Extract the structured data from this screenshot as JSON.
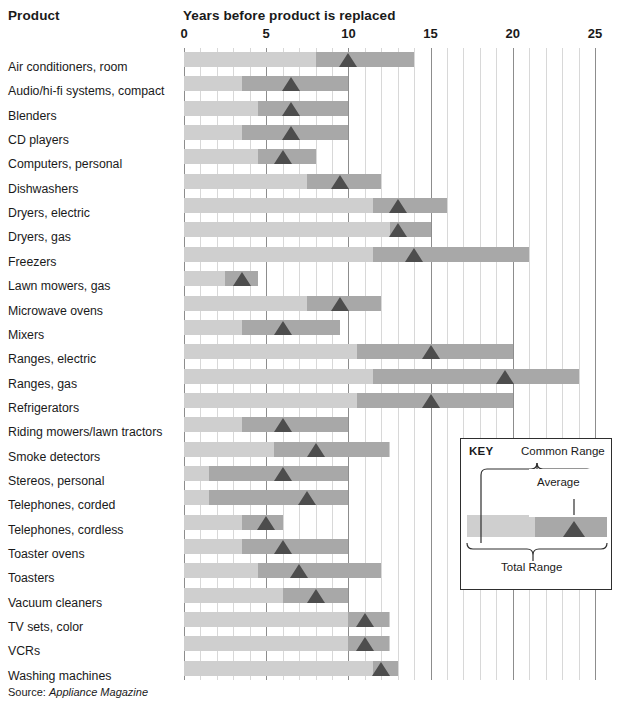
{
  "headers": {
    "product": "Product",
    "axis_title": "Years before product is replaced"
  },
  "source": {
    "prefix": "Source:",
    "name": "Appliance Magazine"
  },
  "key": {
    "title": "KEY",
    "common_range": "Common Range",
    "average": "Average",
    "total_range": "Total Range"
  },
  "colors": {
    "total_range": "#cfcfcf",
    "common_range": "#a8a8a8",
    "average_marker": "#4d4d4d",
    "grid_minor": "#d8d8d8",
    "grid_major": "#8d8d8d",
    "text": "#1a1a1a"
  },
  "chart_data": {
    "type": "bar",
    "title": "Years before product is replaced",
    "xlabel": "Years before product is replaced",
    "ylabel": "Product",
    "xlim": [
      0,
      25
    ],
    "xticks": [
      0,
      5,
      10,
      15,
      20,
      25
    ],
    "xtick_labels": [
      "0",
      "5",
      "10",
      "15",
      "20",
      "25"
    ],
    "grid": true,
    "grid_minor_step": 1,
    "grid_major_step": 5,
    "legend": "KEY box, bottom right",
    "series": [
      {
        "name": "Total Range",
        "kind": "range"
      },
      {
        "name": "Common Range",
        "kind": "range"
      },
      {
        "name": "Average",
        "kind": "marker"
      }
    ],
    "categories": [
      "Air conditioners, room",
      "Audio/hi-fi systems, compact",
      "Blenders",
      "CD players",
      "Computers, personal",
      "Dishwashers",
      "Dryers, electric",
      "Dryers, gas",
      "Freezers",
      "Lawn mowers, gas",
      "Microwave ovens",
      "Mixers",
      "Ranges, electric",
      "Ranges, gas",
      "Refrigerators",
      "Riding mowers/lawn tractors",
      "Smoke detectors",
      "Stereos, personal",
      "Telephones, corded",
      "Telephones, cordless",
      "Toaster ovens",
      "Toasters",
      "Vacuum cleaners",
      "TV sets, color",
      "VCRs",
      "Washing machines"
    ],
    "rows": [
      {
        "label": "Air conditioners, room",
        "total": [
          0,
          14.0
        ],
        "common": [
          8.0,
          14.0
        ],
        "average": 10.0
      },
      {
        "label": "Audio/hi-fi systems, compact",
        "total": [
          0,
          10.0
        ],
        "common": [
          3.5,
          10.0
        ],
        "average": 6.5
      },
      {
        "label": "Blenders",
        "total": [
          0,
          10.0
        ],
        "common": [
          4.5,
          10.0
        ],
        "average": 6.5
      },
      {
        "label": "CD players",
        "total": [
          0,
          10.0
        ],
        "common": [
          3.5,
          10.0
        ],
        "average": 6.5
      },
      {
        "label": "Computers, personal",
        "total": [
          0,
          8.0
        ],
        "common": [
          4.5,
          8.0
        ],
        "average": 6.0
      },
      {
        "label": "Dishwashers",
        "total": [
          0,
          12.0
        ],
        "common": [
          7.5,
          12.0
        ],
        "average": 9.5
      },
      {
        "label": "Dryers, electric",
        "total": [
          0,
          16.0
        ],
        "common": [
          11.5,
          16.0
        ],
        "average": 13.0
      },
      {
        "label": "Dryers, gas",
        "total": [
          0,
          15.0
        ],
        "common": [
          12.5,
          15.0
        ],
        "average": 13.0
      },
      {
        "label": "Freezers",
        "total": [
          0,
          21.0
        ],
        "common": [
          11.5,
          21.0
        ],
        "average": 14.0
      },
      {
        "label": "Lawn mowers, gas",
        "total": [
          0,
          4.5
        ],
        "common": [
          2.5,
          4.5
        ],
        "average": 3.5
      },
      {
        "label": "Microwave ovens",
        "total": [
          0,
          12.0
        ],
        "common": [
          7.5,
          12.0
        ],
        "average": 9.5
      },
      {
        "label": "Mixers",
        "total": [
          0,
          9.5
        ],
        "common": [
          3.5,
          9.5
        ],
        "average": 6.0
      },
      {
        "label": "Ranges, electric",
        "total": [
          0,
          20.0
        ],
        "common": [
          10.5,
          20.0
        ],
        "average": 15.0
      },
      {
        "label": "Ranges, gas",
        "total": [
          0,
          24.0
        ],
        "common": [
          11.5,
          24.0
        ],
        "average": 19.5
      },
      {
        "label": "Refrigerators",
        "total": [
          0,
          20.0
        ],
        "common": [
          10.5,
          20.0
        ],
        "average": 15.0
      },
      {
        "label": "Riding mowers/lawn tractors",
        "total": [
          0,
          10.0
        ],
        "common": [
          3.5,
          10.0
        ],
        "average": 6.0
      },
      {
        "label": "Smoke detectors",
        "total": [
          0,
          12.5
        ],
        "common": [
          5.5,
          12.5
        ],
        "average": 8.0
      },
      {
        "label": "Stereos, personal",
        "total": [
          0,
          10.0
        ],
        "common": [
          1.5,
          10.0
        ],
        "average": 6.0
      },
      {
        "label": "Telephones, corded",
        "total": [
          0,
          10.0
        ],
        "common": [
          1.5,
          10.0
        ],
        "average": 7.5
      },
      {
        "label": "Telephones, cordless",
        "total": [
          0,
          6.0
        ],
        "common": [
          3.5,
          6.0
        ],
        "average": 5.0
      },
      {
        "label": "Toaster ovens",
        "total": [
          0,
          10.0
        ],
        "common": [
          3.5,
          10.0
        ],
        "average": 6.0
      },
      {
        "label": "Toasters",
        "total": [
          0,
          12.0
        ],
        "common": [
          4.5,
          12.0
        ],
        "average": 7.0
      },
      {
        "label": "Vacuum cleaners",
        "total": [
          0,
          10.0
        ],
        "common": [
          6.0,
          10.0
        ],
        "average": 8.0
      },
      {
        "label": "TV sets, color",
        "total": [
          0,
          12.5
        ],
        "common": [
          10.0,
          12.5
        ],
        "average": 11.0
      },
      {
        "label": "VCRs",
        "total": [
          0,
          12.5
        ],
        "common": [
          10.0,
          12.5
        ],
        "average": 11.0
      },
      {
        "label": "Washing machines",
        "total": [
          0,
          13.0
        ],
        "common": [
          11.5,
          13.0
        ],
        "average": 12.0
      }
    ]
  }
}
